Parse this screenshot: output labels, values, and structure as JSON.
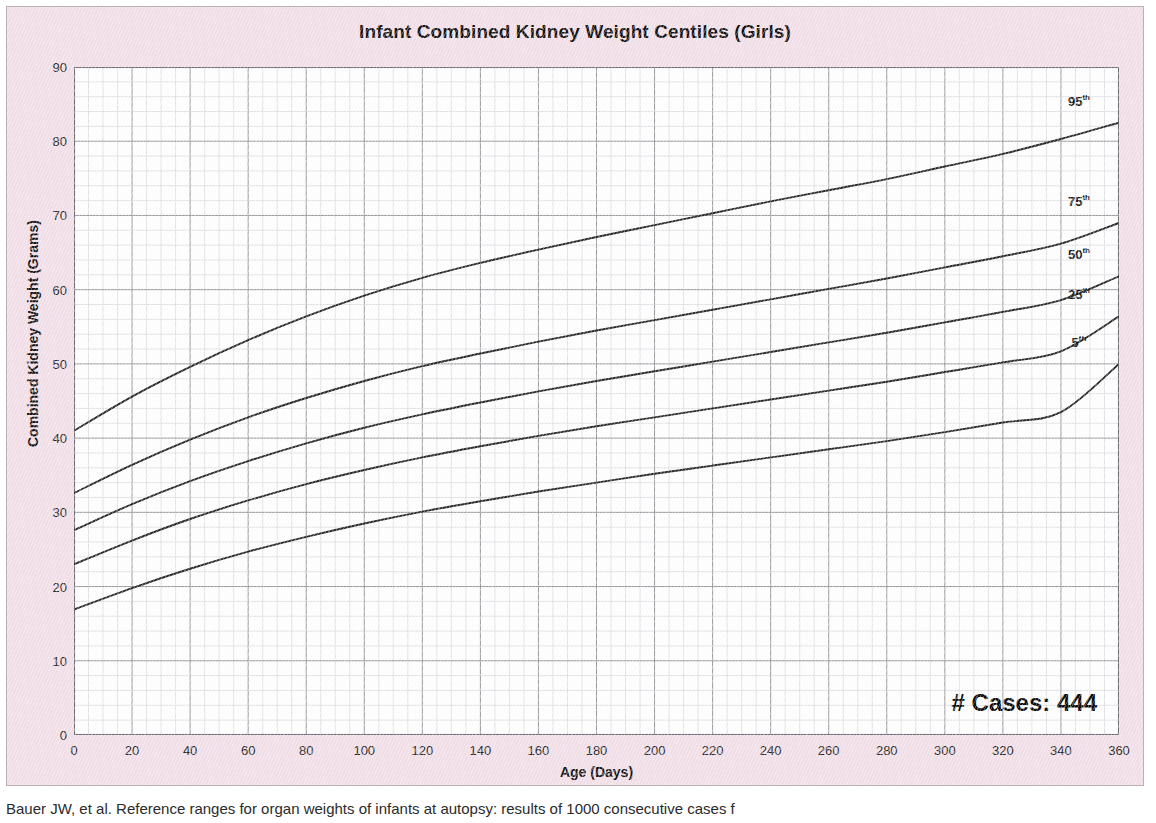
{
  "figure": {
    "background_color": "#f3e0e9",
    "plot_background_color": "#ffffff",
    "border_color": "#b9b2b5"
  },
  "annotation": {
    "cases_label": "# Cases: 444"
  },
  "caption": {
    "text": "Bauer JW, et al. Reference ranges for organ weights of infants at autopsy: results of 1000 consecutive cases f"
  },
  "chart_data": {
    "type": "line",
    "title": "Infant Combined Kidney Weight Centiles (Girls)",
    "xlabel": "Age (Days)",
    "ylabel": "Combined Kidney Weight (Grams)",
    "xlim": [
      0,
      360
    ],
    "ylim": [
      0,
      90
    ],
    "xticks": [
      0,
      20,
      40,
      60,
      80,
      100,
      120,
      140,
      160,
      180,
      200,
      220,
      240,
      260,
      280,
      300,
      320,
      340,
      360
    ],
    "yticks": [
      0,
      10,
      20,
      30,
      40,
      50,
      60,
      70,
      80,
      90
    ],
    "x_minor_step": 5,
    "y_minor_step": 2,
    "grid": true,
    "legend_position": "line-end-labels",
    "line_color": "#2b2b2b",
    "x": [
      0,
      20,
      40,
      60,
      80,
      100,
      120,
      140,
      160,
      180,
      200,
      220,
      240,
      260,
      280,
      300,
      320,
      340,
      360
    ],
    "series": [
      {
        "name": "95th",
        "label": "95",
        "suffix": "th",
        "values": [
          41.0,
          45.6,
          49.6,
          53.2,
          56.4,
          59.2,
          61.6,
          63.6,
          65.4,
          67.1,
          68.7,
          70.3,
          71.9,
          73.4,
          74.9,
          76.6,
          78.3,
          80.3,
          82.5
        ]
      },
      {
        "name": "75th",
        "label": "75",
        "suffix": "th",
        "values": [
          32.6,
          36.4,
          39.8,
          42.8,
          45.4,
          47.7,
          49.7,
          51.4,
          53.0,
          54.5,
          55.9,
          57.3,
          58.7,
          60.1,
          61.5,
          63.0,
          64.5,
          66.2,
          69.0
        ]
      },
      {
        "name": "50th",
        "label": "50",
        "suffix": "th",
        "values": [
          27.6,
          31.1,
          34.2,
          36.9,
          39.3,
          41.4,
          43.2,
          44.8,
          46.3,
          47.7,
          49.0,
          50.3,
          51.6,
          52.9,
          54.2,
          55.6,
          57.0,
          58.6,
          61.8
        ]
      },
      {
        "name": "25th",
        "label": "25",
        "suffix": "th",
        "values": [
          23.0,
          26.2,
          29.1,
          31.6,
          33.8,
          35.7,
          37.4,
          38.9,
          40.3,
          41.6,
          42.8,
          44.0,
          45.2,
          46.4,
          47.6,
          48.9,
          50.2,
          51.7,
          56.4
        ]
      },
      {
        "name": "5th",
        "label": "5",
        "suffix": "th",
        "values": [
          16.9,
          19.8,
          22.4,
          24.7,
          26.7,
          28.5,
          30.1,
          31.5,
          32.8,
          34.0,
          35.2,
          36.3,
          37.4,
          38.5,
          39.6,
          40.8,
          42.1,
          43.5,
          50.0
        ]
      }
    ]
  }
}
